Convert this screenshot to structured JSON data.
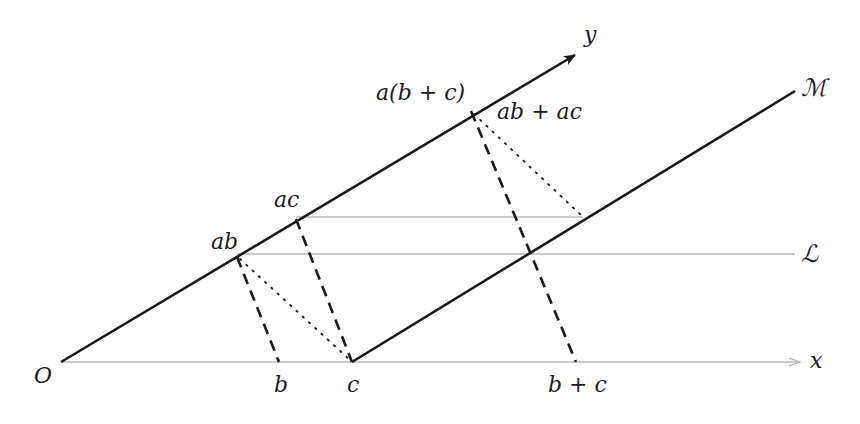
{
  "diagram": {
    "type": "geometric-construction",
    "colors": {
      "ink": "#1a1a1a",
      "gray_line": "#b8b8b8"
    },
    "points": {
      "O": {
        "label": "O",
        "x": 61,
        "y": 362
      },
      "b": {
        "label": "b",
        "x": 279,
        "y": 362
      },
      "c": {
        "label": "c",
        "x": 352,
        "y": 362
      },
      "b_plus_c": {
        "label": "b + c",
        "x": 576,
        "y": 362
      },
      "ab": {
        "label": "ab",
        "x": 237,
        "y": 257
      },
      "ac": {
        "label": "ac",
        "x": 296,
        "y": 219
      },
      "a_b_plus_c": {
        "label": "a(b + c)",
        "x": 471,
        "y": 111
      },
      "ab_plus_ac": {
        "label": "ab + ac",
        "x": 583,
        "y": 217
      }
    },
    "axes": {
      "x": {
        "label": "x"
      },
      "y": {
        "label": "y"
      }
    },
    "lines": {
      "L": {
        "label": "ℒ"
      },
      "M": {
        "label": "ℳ"
      }
    }
  }
}
